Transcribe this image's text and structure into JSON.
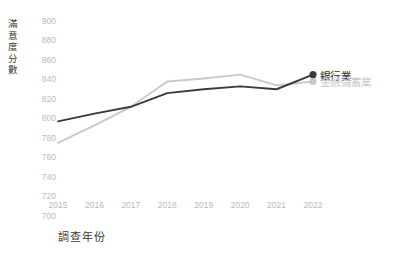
{
  "chart_data": {
    "type": "line",
    "title": "",
    "xlabel": "調查年份",
    "ylabel": "滿意度分數",
    "categories": [
      "2015",
      "2016",
      "2017",
      "2018",
      "2019",
      "2020",
      "2021",
      "2022"
    ],
    "x": [
      2015,
      2016,
      2017,
      2018,
      2019,
      2020,
      2021,
      2022
    ],
    "ylim": [
      700,
      900
    ],
    "ytick_labels": [
      "900",
      "880",
      "860",
      "840",
      "820",
      "800",
      "780",
      "760",
      "740",
      "720",
      "700"
    ],
    "yticks": [
      900,
      880,
      860,
      840,
      820,
      800,
      780,
      760,
      740,
      720,
      700
    ],
    "ytick_step": 20,
    "grid": false,
    "legend_position": "right-inline-end-of-line",
    "series": [
      {
        "name": "銀行業",
        "color": "#3b3b3b",
        "marker": "circle",
        "marker_at_last_point": true,
        "values": [
          797,
          805,
          812,
          826,
          830,
          833,
          830,
          845
        ]
      },
      {
        "name": "金融儲蓄業",
        "color": "#c9c9cd",
        "marker": "circle",
        "marker_at_last_point": true,
        "values": [
          775,
          793,
          812,
          838,
          841,
          845,
          834,
          838
        ]
      }
    ]
  },
  "legend": {
    "bank_label": "銀行業",
    "savings_label": "金融儲蓄業"
  },
  "axes": {
    "y_title_chars": [
      "滿",
      "意",
      "度",
      "分",
      "數"
    ],
    "x_title": "調查年份"
  },
  "colors": {
    "bank": "#3b3b3b",
    "savings": "#c9c9cd",
    "tick_text": "#b9b9bd",
    "axis_title_text": "#3a3a3a",
    "background": "#ffffff"
  }
}
